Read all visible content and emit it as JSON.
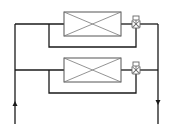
{
  "diagram": {
    "type": "hydraulic-schematic",
    "colors": {
      "line": "#1a1a1a",
      "box_border": "#555555",
      "box_cross": "#777777",
      "valve": "#666666",
      "background": "#ffffff"
    },
    "supply_line": {
      "direction": "up",
      "label": ""
    },
    "return_line": {
      "direction": "down",
      "label": ""
    },
    "units": [
      {
        "id": "unit-1",
        "name": "coil-1",
        "valve": "three-way-valve-1"
      },
      {
        "id": "unit-2",
        "name": "coil-2",
        "valve": "three-way-valve-2"
      }
    ]
  }
}
